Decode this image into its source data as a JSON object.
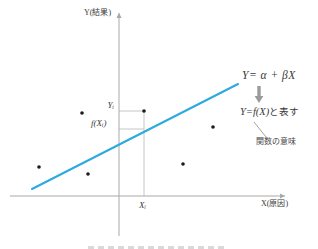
{
  "colors": {
    "regression_line": "#2CA9E1",
    "axis": "#a9a9a9",
    "helper_line": "#c6c6c6",
    "leader_line": "#8c8c8c",
    "dot": "#1b1b1b",
    "block_arrow": "#9b9b9b",
    "caption_sliver": "#d9d9d9"
  },
  "axes": {
    "y": {
      "label": "Y(結果)",
      "x": 119,
      "top": 13,
      "bottom": 236
    },
    "x": {
      "label": "X(原因)",
      "y": 196,
      "left": 10,
      "right": 285
    }
  },
  "regression_line": {
    "x1": 32,
    "y1": 189,
    "x2": 238,
    "y2": 84
  },
  "scatter_points": [
    {
      "x": 39,
      "y": 167
    },
    {
      "x": 82,
      "y": 113
    },
    {
      "x": 88,
      "y": 174
    },
    {
      "x": 144,
      "y": 111
    },
    {
      "x": 183,
      "y": 164
    },
    {
      "x": 213,
      "y": 127
    }
  ],
  "marked_point": {
    "x": 144,
    "y": 111,
    "fitted_y": 129
  },
  "point_labels": {
    "y_i": "Yᵢ",
    "f_x_i": "f(Xᵢ)",
    "x_i": "Xᵢ"
  },
  "annotations": {
    "model_formula": "Y= α + βX",
    "function_formula_math": "Y=f(X)",
    "function_formula_suffix": "と表す",
    "function_note": "関数の意味"
  },
  "leader_line": {
    "x1": 254,
    "y1": 122,
    "x2": 266,
    "y2": 137
  },
  "block_arrow": {
    "cx": 259,
    "top": 86,
    "bottom": 103
  }
}
